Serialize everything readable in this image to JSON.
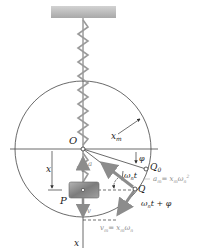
{
  "diagram": {
    "labels": {
      "origin": "O",
      "radius": "x",
      "radius_sub": "m",
      "phase": "φ",
      "angle": "ω",
      "angle_sub": "n",
      "angle_t": "t",
      "q0": "Q",
      "q0_sub": "0",
      "q": "Q",
      "total_angle": "ω",
      "total_angle_sub": "n",
      "total_angle_rest": "t + φ",
      "accel_small": "a",
      "accel_max": "a",
      "accel_max_sub": "m",
      "accel_max_eq": "= x",
      "accel_max_eq_sub": "m",
      "accel_max_omega": "ω",
      "accel_max_omega_sub": "n",
      "accel_max_omega_sup": "2",
      "displacement": "x",
      "mass": "P",
      "velocity_small": "v",
      "velocity_max": "v",
      "velocity_max_sub": "m",
      "velocity_max_eq": "= x",
      "velocity_max_eq_sub": "m",
      "velocity_max_omega": "ω",
      "velocity_max_omega_sub": "n",
      "axis": "x"
    },
    "colors": {
      "line": "#333333",
      "gray_arrow": "#8c8c8c",
      "ceiling": "#bdbdbd",
      "block": "#8f8f8f",
      "spring": "#9a9a9a"
    }
  }
}
